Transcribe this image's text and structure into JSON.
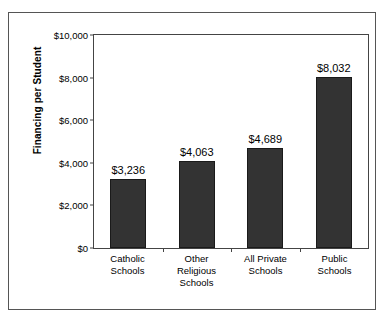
{
  "chart_data": {
    "type": "bar",
    "title": "",
    "xlabel": "",
    "ylabel": "Financing per Student",
    "categories": [
      "Catholic Schools",
      "Other Religious Schools",
      "All Private Schools",
      "Public Schools"
    ],
    "category_lines": [
      [
        "Catholic",
        "Schools"
      ],
      [
        "Other",
        "Religious",
        "Schools"
      ],
      [
        "All Private",
        "Schools"
      ],
      [
        "Public",
        "Schools"
      ]
    ],
    "values": [
      3236,
      4063,
      4689,
      8032
    ],
    "value_labels": [
      "$3,236",
      "$4,063",
      "$4,689",
      "$8,032"
    ],
    "ylim": [
      0,
      10000
    ],
    "ytick_values": [
      0,
      2000,
      4000,
      6000,
      8000,
      10000
    ],
    "ytick_labels": [
      "$0",
      "$2,000",
      "$4,000",
      "$6,000",
      "$8,000",
      "$10,000"
    ],
    "grid": false,
    "legend": null,
    "bar_color": "#333333",
    "frame_color": "#555555",
    "axis_color": "#444444",
    "background_color": "#ffffff"
  }
}
